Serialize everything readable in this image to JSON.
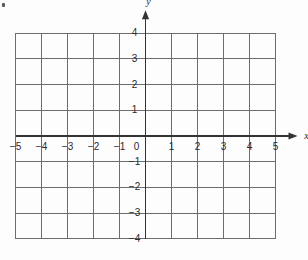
{
  "chart_data": {
    "type": "scatter",
    "title": "",
    "subtitle": "",
    "xlabel": "x",
    "ylabel": "y",
    "xlim": [
      -5,
      5
    ],
    "ylim": [
      -4,
      4
    ],
    "xticks": [
      "-5",
      "-4",
      "-3",
      "-2",
      "-1",
      "0",
      "1",
      "2",
      "3",
      "4",
      "5"
    ],
    "yticks": [
      "-4",
      "-3",
      "-2",
      "-1",
      "1",
      "2",
      "3",
      "4"
    ],
    "xtick_values": [
      -5,
      -4,
      -3,
      -2,
      -1,
      0,
      1,
      2,
      3,
      4,
      5
    ],
    "ytick_values": [
      -4,
      -3,
      -2,
      -1,
      1,
      2,
      3,
      4
    ],
    "origin_label": "0",
    "grid": true,
    "grid_step": 1,
    "legend": null,
    "series": [],
    "values": [],
    "annotations": [],
    "axis_arrows": [
      "x-positive",
      "y-positive"
    ],
    "colors": {
      "background": "#fdfdfd",
      "grid_line": "#6d6d6d",
      "axis_line": "#333333",
      "tick_text": "#2a2a2a"
    }
  },
  "figure": {
    "name": "blank-cartesian-coordinate-grid",
    "x_axis_name": "x-axis",
    "y_axis_name": "y-axis",
    "speck_name": "scan-artifact-speck"
  }
}
